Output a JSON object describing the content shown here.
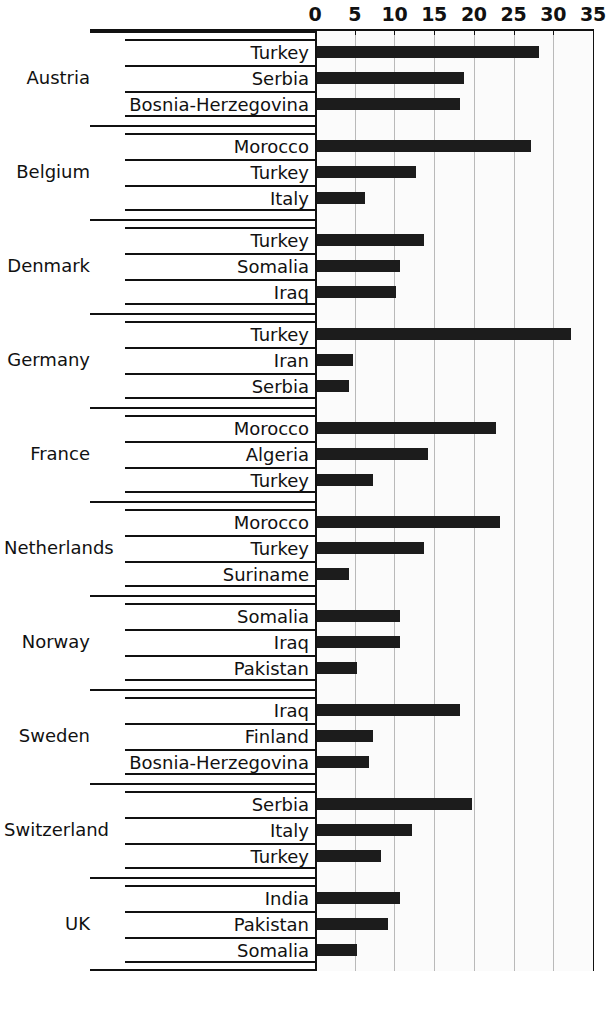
{
  "chart": {
    "type": "bar",
    "orientation": "horizontal",
    "title": "",
    "xlabel": "",
    "ylabel": "",
    "xlim": [
      0,
      35
    ],
    "xticks": [
      0,
      5,
      10,
      15,
      20,
      25,
      30,
      35
    ],
    "grid": "vertical",
    "legend": "none",
    "bar_color": "#1c1c1c"
  },
  "chart_data": {
    "type": "bar",
    "title": "",
    "xlabel": "",
    "ylabel": "",
    "xlim": [
      0,
      35
    ],
    "xticks": [
      "0",
      "5",
      "10",
      "15",
      "20",
      "25",
      "30",
      "35"
    ],
    "grid": true,
    "legend_position": "none",
    "groups": [
      {
        "country": "Austria",
        "items": [
          {
            "label": "Turkey",
            "value": 28.0
          },
          {
            "label": "Serbia",
            "value": 18.5
          },
          {
            "label": "Bosnia-Herzegovina",
            "value": 18.0
          }
        ]
      },
      {
        "country": "Belgium",
        "items": [
          {
            "label": "Morocco",
            "value": 27.0
          },
          {
            "label": "Turkey",
            "value": 12.5
          },
          {
            "label": "Italy",
            "value": 6.0
          }
        ]
      },
      {
        "country": "Denmark",
        "items": [
          {
            "label": "Turkey",
            "value": 13.5
          },
          {
            "label": "Somalia",
            "value": 10.5
          },
          {
            "label": "Iraq",
            "value": 10.0
          }
        ]
      },
      {
        "country": "Germany",
        "items": [
          {
            "label": "Turkey",
            "value": 32.0
          },
          {
            "label": "Iran",
            "value": 4.5
          },
          {
            "label": "Serbia",
            "value": 4.0
          }
        ]
      },
      {
        "country": "France",
        "items": [
          {
            "label": "Morocco",
            "value": 22.5
          },
          {
            "label": "Algeria",
            "value": 14.0
          },
          {
            "label": "Turkey",
            "value": 7.0
          }
        ]
      },
      {
        "country": "Netherlands",
        "items": [
          {
            "label": "Morocco",
            "value": 23.0
          },
          {
            "label": "Turkey",
            "value": 13.5
          },
          {
            "label": "Suriname",
            "value": 4.0
          }
        ]
      },
      {
        "country": "Norway",
        "items": [
          {
            "label": "Somalia",
            "value": 10.5
          },
          {
            "label": "Iraq",
            "value": 10.5
          },
          {
            "label": "Pakistan",
            "value": 5.0
          }
        ]
      },
      {
        "country": "Sweden",
        "items": [
          {
            "label": "Iraq",
            "value": 18.0
          },
          {
            "label": "Finland",
            "value": 7.0
          },
          {
            "label": "Bosnia-Herzegovina",
            "value": 6.5
          }
        ]
      },
      {
        "country": "Switzerland",
        "items": [
          {
            "label": "Serbia",
            "value": 19.5
          },
          {
            "label": "Italy",
            "value": 12.0
          },
          {
            "label": "Turkey",
            "value": 8.0
          }
        ]
      },
      {
        "country": "UK",
        "items": [
          {
            "label": "India",
            "value": 10.5
          },
          {
            "label": "Pakistan",
            "value": 9.0
          },
          {
            "label": "Somalia",
            "value": 5.0
          }
        ]
      }
    ]
  }
}
